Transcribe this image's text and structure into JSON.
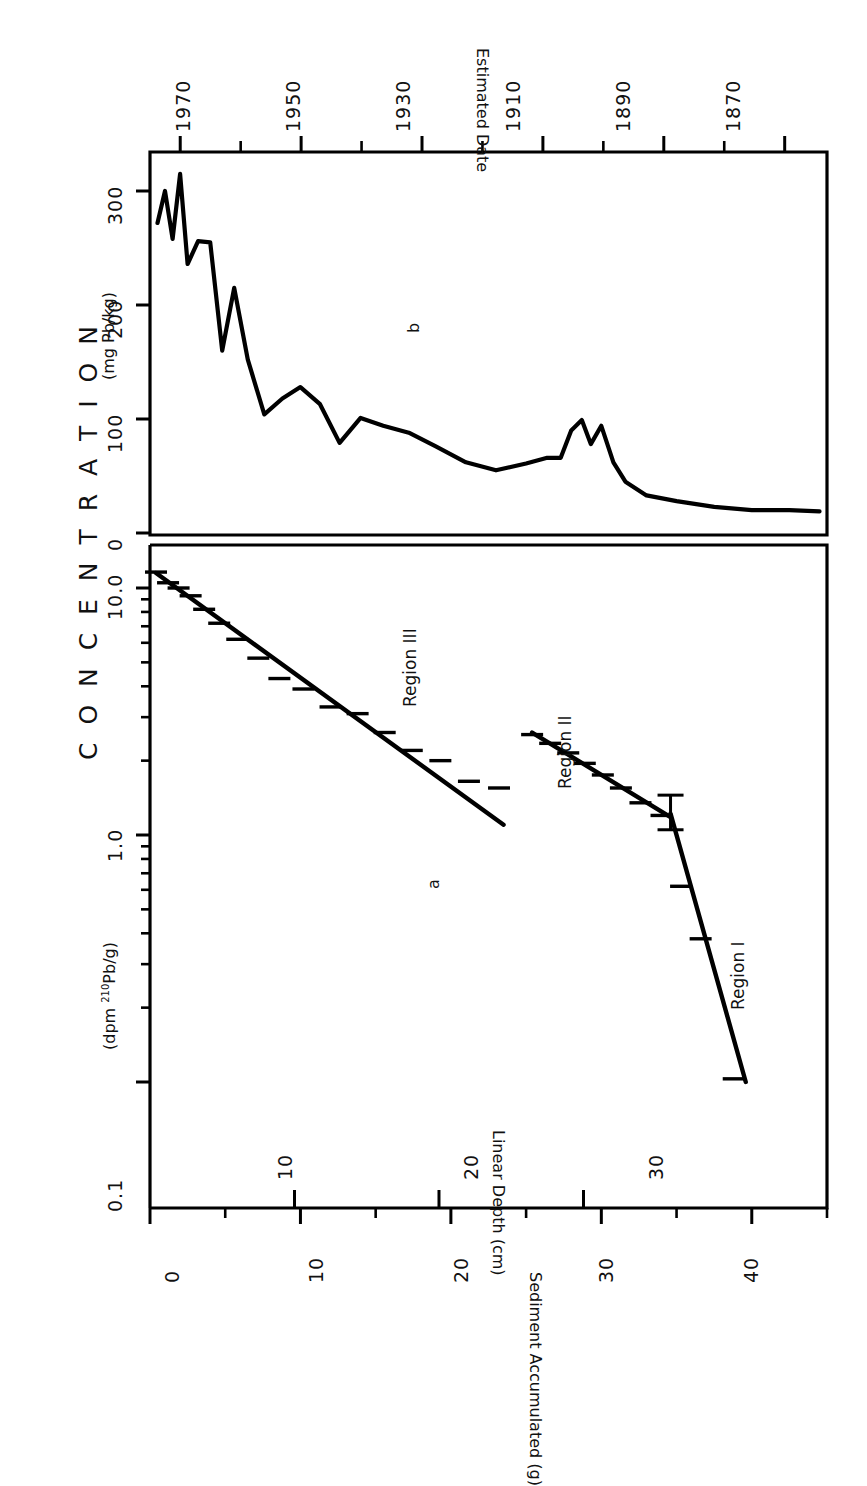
{
  "figure": {
    "orientation": "rotated-90-counterclockwise",
    "main_title": "C O N C E N T R A T I O N",
    "panel_a_label": "a",
    "panel_b_label": "b"
  },
  "axes": {
    "concentration_log": {
      "label": "(dpm 210Pb/g)",
      "label_prefix": "(dpm ",
      "label_sup": "210",
      "label_suffix": "Pb/g)",
      "ticks": [
        "10.0",
        "1.0",
        "0.1"
      ],
      "scale": "log"
    },
    "pb_linear": {
      "label": "(mg Pb/kg)",
      "ticks": [
        "300",
        "200",
        "100",
        "0"
      ],
      "scale": "linear"
    },
    "sediment": {
      "label": "Sediment Accumulated (g)",
      "ticks": [
        "0",
        "10",
        "20",
        "30",
        "40"
      ]
    },
    "depth": {
      "label": "Linear Depth (cm)",
      "ticks": [
        "10",
        "20",
        "30"
      ]
    },
    "date": {
      "label": "Estimated Date",
      "ticks": [
        "1970",
        "1950",
        "1930",
        "1910",
        "1890",
        "1870"
      ]
    }
  },
  "regions": [
    {
      "name": "Region I"
    },
    {
      "name": "Region II"
    },
    {
      "name": "Region III"
    }
  ],
  "colors": {
    "ink": "#000000",
    "background": "#ffffff"
  },
  "chart_data": [
    {
      "type": "scatter",
      "id": "panel-a",
      "title": "C O N C E N T R A T I O N",
      "panel": "a",
      "xlabel": "Sediment Accumulated (g)",
      "ylabel": "(dpm 210Pb/g)",
      "xlim": [
        0,
        45
      ],
      "ylim": [
        0.08,
        14
      ],
      "yscale": "log",
      "grid": false,
      "legend": "none",
      "secondary_x": {
        "label": "Linear Depth (cm)",
        "ticks": [
          10,
          20,
          30
        ]
      },
      "secondary_y_panel": {
        "label": "Estimated Date",
        "ticks": [
          1970,
          1950,
          1930,
          1910,
          1890,
          1870
        ]
      },
      "x": [
        0.4,
        1.2,
        1.9,
        2.7,
        3.6,
        4.6,
        5.8,
        7.2,
        8.6,
        10.2,
        12.0,
        13.8,
        15.6,
        17.4,
        19.3,
        21.2,
        23.2,
        25.4,
        26.6,
        27.8,
        28.9,
        30.1,
        31.3,
        32.6,
        34.0,
        35.3,
        36.6,
        38.8
      ],
      "y": [
        11.6,
        10.5,
        10.0,
        9.3,
        8.2,
        7.2,
        6.2,
        5.2,
        4.3,
        3.9,
        3.3,
        3.1,
        2.6,
        2.2,
        2.0,
        1.65,
        1.55,
        2.55,
        2.35,
        2.15,
        1.95,
        1.75,
        1.55,
        1.35,
        1.2,
        0.62,
        0.38,
        0.103
      ],
      "y_err": [
        0.6,
        0.5,
        0.5,
        0.4,
        0.35,
        0.3,
        0.3,
        0.25,
        0.22,
        0.2,
        0.18,
        0.17,
        0.15,
        0.13,
        0.12,
        0.1,
        0.1,
        0.16,
        0.14,
        0.13,
        0.12,
        0.11,
        0.1,
        0.09,
        0.09,
        0.06,
        0.05,
        0.02
      ],
      "fits": [
        {
          "region": "Region III",
          "x0": 0.4,
          "y0": 11.5,
          "x1": 23.5,
          "y1": 1.1
        },
        {
          "region": "Region II",
          "x0": 25.4,
          "y0": 2.6,
          "x1": 34.6,
          "y1": 1.18
        },
        {
          "region": "Region I",
          "x0": 34.6,
          "y0": 1.22,
          "x1": 39.6,
          "y1": 0.1
        }
      ],
      "annotations": [
        "a",
        "Region III",
        "Region II",
        "Region I"
      ]
    },
    {
      "type": "line",
      "id": "panel-b",
      "panel": "b",
      "xlabel": "Sediment Accumulated (g)",
      "ylabel": "(mg Pb/kg)",
      "xlim": [
        0,
        45
      ],
      "ylim": [
        0,
        330
      ],
      "grid": false,
      "legend": "none",
      "secondary_x_top": {
        "label": "Estimated Date",
        "ticks": [
          1970,
          1950,
          1930,
          1910,
          1890,
          1870
        ]
      },
      "x": [
        0.5,
        1.0,
        1.5,
        2.0,
        2.5,
        3.2,
        4.0,
        4.8,
        5.6,
        6.5,
        7.6,
        8.8,
        10.0,
        11.3,
        12.6,
        14.0,
        15.5,
        17.2,
        19.0,
        21.0,
        23.0,
        25.0,
        26.4,
        27.3,
        28.0,
        28.7,
        29.3,
        30.0,
        30.8,
        31.6,
        33.0,
        35.0,
        37.5,
        40.0,
        42.5,
        44.5
      ],
      "y": [
        272,
        300,
        258,
        315,
        236,
        256,
        255,
        160,
        215,
        152,
        104,
        118,
        128,
        113,
        79,
        101,
        94,
        88,
        76,
        62,
        55,
        61,
        66,
        66,
        90,
        99,
        78,
        94,
        62,
        45,
        33,
        28,
        23,
        20,
        20,
        19
      ],
      "annotations": [
        "b"
      ]
    }
  ]
}
